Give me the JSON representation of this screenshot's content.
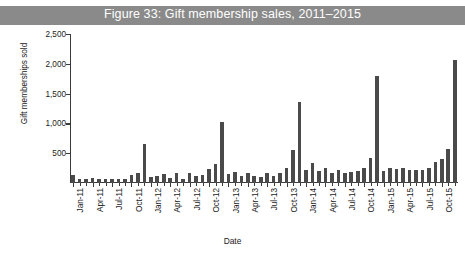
{
  "figure": {
    "title": "Figure 33: Gift membership sales, 2011–2015",
    "banner_color": "#8a8a8a",
    "bar_color": "#4a4a4a",
    "axis_color": "#3b3b3b"
  },
  "chart_data": {
    "type": "bar",
    "title": "Figure 33: Gift membership sales, 2011–2015",
    "xlabel": "Date",
    "ylabel": "Gift memberships sold",
    "ylim": [
      0,
      2500
    ],
    "yticks": [
      0,
      500,
      1000,
      1500,
      2000,
      2500
    ],
    "ytick_labels": [
      "",
      "500",
      "1,000",
      "1,500",
      "2,000",
      "2,500"
    ],
    "grid": false,
    "legend": null,
    "categories": [
      "Jan-11",
      "Feb-11",
      "Mar-11",
      "Apr-11",
      "May-11",
      "Jun-11",
      "Jul-11",
      "Aug-11",
      "Sep-11",
      "Oct-11",
      "Nov-11",
      "Dec-11",
      "Jan-12",
      "Feb-12",
      "Mar-12",
      "Apr-12",
      "May-12",
      "Jun-12",
      "Jul-12",
      "Aug-12",
      "Sep-12",
      "Oct-12",
      "Nov-12",
      "Dec-12",
      "Jan-13",
      "Feb-13",
      "Mar-13",
      "Apr-13",
      "May-13",
      "Jun-13",
      "Jul-13",
      "Aug-13",
      "Sep-13",
      "Oct-13",
      "Nov-13",
      "Dec-13",
      "Jan-14",
      "Feb-14",
      "Mar-14",
      "Apr-14",
      "May-14",
      "Jun-14",
      "Jul-14",
      "Aug-14",
      "Sep-14",
      "Oct-14",
      "Nov-14",
      "Dec-14",
      "Jan-15",
      "Feb-15",
      "Mar-15",
      "Apr-15",
      "May-15",
      "Jun-15",
      "Jul-15",
      "Aug-15",
      "Sep-15",
      "Oct-15",
      "Nov-15",
      "Dec-15"
    ],
    "xtick_labels": [
      "Jan-11",
      "Apr-11",
      "Jul-11",
      "Oct-11",
      "Jan-12",
      "Apr-12",
      "Jul-12",
      "Oct-12",
      "Jan-13",
      "Apr-13",
      "Jul-13",
      "Oct-13",
      "Jan-14",
      "Apr-14",
      "Jul-14",
      "Oct-14",
      "Jan-15",
      "Apr-15",
      "Jul-15",
      "Oct-15"
    ],
    "values": [
      130,
      75,
      70,
      80,
      70,
      65,
      60,
      70,
      75,
      140,
      175,
      660,
      95,
      110,
      150,
      80,
      170,
      60,
      175,
      110,
      135,
      230,
      320,
      1030,
      150,
      190,
      110,
      165,
      110,
      100,
      170,
      110,
      160,
      255,
      560,
      1360,
      215,
      330,
      200,
      260,
      175,
      215,
      170,
      190,
      200,
      250,
      420,
      1800,
      200,
      250,
      230,
      260,
      210,
      220,
      215,
      250,
      360,
      400,
      570,
      2070
    ]
  }
}
